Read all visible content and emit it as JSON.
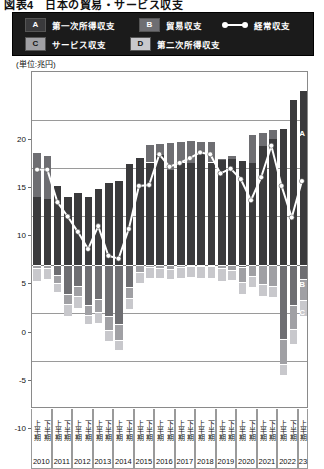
{
  "figure": {
    "title_partial": "図表4　日本の貿易・サービス収支",
    "unit_label": "(単位:兆円)"
  },
  "legend": {
    "items": [
      {
        "key": "A",
        "label": "第一次所得収支",
        "color": "#3a3a3c"
      },
      {
        "key": "B",
        "label": "貿易収支",
        "color": "#6e6e72"
      },
      {
        "key": "C",
        "label": "サービス収支",
        "color": "#a0a0a4"
      },
      {
        "key": "D",
        "label": "第二次所得収支",
        "color": "#c8c8cc"
      }
    ],
    "line_series": {
      "label": "経常収支",
      "color": "#ffffff"
    }
  },
  "inline_tags": {
    "a": "A",
    "b": "B",
    "c": "C",
    "d": "D"
  },
  "chart_data": {
    "type": "bar",
    "subtitle": "",
    "xlabel": "",
    "ylabel": "",
    "unit": "兆円",
    "ylim": [
      -15,
      20
    ],
    "yticks": [
      20,
      15,
      10,
      5,
      0,
      -5,
      -10,
      -15
    ],
    "ytick_labels": [
      "20",
      "15",
      "10",
      "5",
      "0",
      "-5",
      "-10",
      "-15"
    ],
    "grid": true,
    "stacked": true,
    "legend_position": "top",
    "categories": [
      "2010 上半期",
      "2010 下半期",
      "2011 上半期",
      "2011 下半期",
      "2012 上半期",
      "2012 下半期",
      "2013 上半期",
      "2013 下半期",
      "2014 上半期",
      "2014 下半期",
      "2015 上半期",
      "2015 下半期",
      "2016 上半期",
      "2016 下半期",
      "2017 上半期",
      "2017 下半期",
      "2018 上半期",
      "2018 下半期",
      "2019 上半期",
      "2019 下半期",
      "2020 上半期",
      "2020 下半期",
      "2021 上半期",
      "2021 下半期",
      "2022 上半期",
      "2022 下半期",
      "2023 上半期"
    ],
    "year_groups": [
      {
        "year": "2010",
        "halves": [
          "上半期",
          "下半期"
        ]
      },
      {
        "year": "2011",
        "halves": [
          "上半期",
          "下半期"
        ]
      },
      {
        "year": "2012",
        "halves": [
          "上半期",
          "下半期"
        ]
      },
      {
        "year": "2013",
        "halves": [
          "上半期",
          "下半期"
        ]
      },
      {
        "year": "2014",
        "halves": [
          "上半期",
          "下半期"
        ]
      },
      {
        "year": "2015",
        "halves": [
          "上半期",
          "下半期"
        ]
      },
      {
        "year": "2016",
        "halves": [
          "上半期",
          "下半期"
        ]
      },
      {
        "year": "2017",
        "halves": [
          "上半期",
          "下半期"
        ]
      },
      {
        "year": "2018",
        "halves": [
          "上半期",
          "下半期"
        ]
      },
      {
        "year": "2019",
        "halves": [
          "上半期",
          "下半期"
        ]
      },
      {
        "year": "2020",
        "halves": [
          "上半期",
          "下半期"
        ]
      },
      {
        "year": "2021",
        "halves": [
          "上半期",
          "下半期"
        ]
      },
      {
        "year": "2022",
        "halves": [
          "上半期",
          "下半期"
        ]
      },
      {
        "year": "23",
        "halves": [
          "上半期"
        ]
      }
    ],
    "series": [
      {
        "name": "第一次所得収支",
        "key": "A",
        "color": "#3a3a3c",
        "values": [
          7.0,
          6.8,
          8.2,
          7.0,
          7.4,
          7.0,
          7.9,
          8.5,
          8.7,
          10.4,
          11.1,
          10.6,
          11.4,
          9.8,
          10.6,
          10.6,
          11.7,
          10.6,
          10.9,
          11.0,
          10.8,
          10.5,
          12.3,
          13.0,
          14.1,
          17.1,
          18.0
        ]
      },
      {
        "name": "貿易収支",
        "key": "B",
        "color": "#6e6e72",
        "values": [
          4.7,
          4.6,
          -1.1,
          -3.1,
          -2.2,
          -4.2,
          -3.6,
          -5.3,
          -6.2,
          -2.3,
          0.0,
          1.9,
          1.2,
          2.9,
          2.2,
          2.3,
          1.1,
          2.2,
          0.2,
          0.4,
          -0.3,
          3.1,
          1.5,
          1.1,
          -7.7,
          -4.2,
          -1.5
        ]
      },
      {
        "name": "サービス収支",
        "key": "C",
        "color": "#a0a0a4",
        "values": [
          -0.4,
          -0.4,
          -0.8,
          -1.0,
          -1.1,
          -1.0,
          -1.3,
          -1.5,
          -1.6,
          -1.2,
          -0.8,
          -0.3,
          -0.4,
          -0.5,
          -0.3,
          -0.2,
          -0.2,
          -0.2,
          -0.4,
          -0.6,
          -1.5,
          -1.2,
          -2.0,
          -2.2,
          -2.6,
          -2.5,
          -2.2
        ]
      },
      {
        "name": "第二次所得収支",
        "key": "D",
        "color": "#c8c8cc",
        "values": [
          -1.3,
          -1.1,
          -1.0,
          -1.2,
          -1.2,
          -1.0,
          -1.2,
          -1.1,
          -1.1,
          -1.1,
          -1.1,
          -1.1,
          -1.0,
          -1.0,
          -1.1,
          -1.1,
          -1.2,
          -1.2,
          -1.3,
          -1.0,
          -1.3,
          -1.1,
          -1.3,
          -1.2,
          -1.2,
          -1.5,
          -1.6
        ]
      }
    ],
    "line_series": {
      "name": "経常収支",
      "color": "#ffffff",
      "marker": "circle",
      "values": [
        9.8,
        9.8,
        6.4,
        4.9,
        3.3,
        1.5,
        3.9,
        0.8,
        0.5,
        3.6,
        8.1,
        8.2,
        11.4,
        10.1,
        10.5,
        11.0,
        11.6,
        11.4,
        9.4,
        9.9,
        8.8,
        6.6,
        9.0,
        12.3,
        8.1,
        4.8,
        8.6
      ]
    }
  }
}
